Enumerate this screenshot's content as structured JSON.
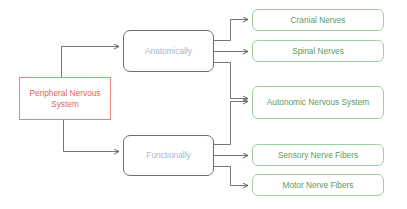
{
  "diagram": {
    "type": "tree",
    "colors": {
      "root_border": "#e8857c",
      "root_text": "#e0675c",
      "mid_border": "#6f6f6f",
      "mid_text": "#a9b4cf",
      "leaf_border": "#9fcfa4",
      "leaf_text": "#5a9a62",
      "connector": "#555555"
    },
    "root": {
      "label": "Peripheral Nervous System"
    },
    "branches": [
      {
        "label": "Anatomically",
        "children": [
          "Cranial Nerves",
          "Spinal Nerves",
          "Autonomic Nervous System"
        ]
      },
      {
        "label": "Functionally",
        "children": [
          "Autonomic Nervous System",
          "Sensory Nerve Fibers",
          "Motor Nerve Fibers"
        ]
      }
    ],
    "leaves": {
      "cranial": "Cranial Nerves",
      "spinal": "Spinal Nerves",
      "autonomic": "Autonomic Nervous System",
      "sensory": "Sensory Nerve Fibers",
      "motor": "Motor Nerve Fibers"
    }
  }
}
